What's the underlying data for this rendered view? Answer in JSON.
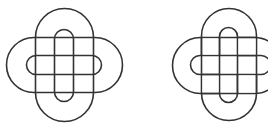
{
  "figures": [
    {
      "name": "knot-grid-interlaced",
      "description": "Two interlocking stadium loops (vertical and horizontal), each drawn as a double-outline band, forming a square grid at the center",
      "stroke_color": "#333333",
      "background": "#ffffff"
    },
    {
      "name": "knot-offset-interlaced",
      "description": "Two interlaced stadium loops offset diagonally, forming an over-under knot",
      "stroke_color": "#333333",
      "background": "#ffffff"
    }
  ]
}
